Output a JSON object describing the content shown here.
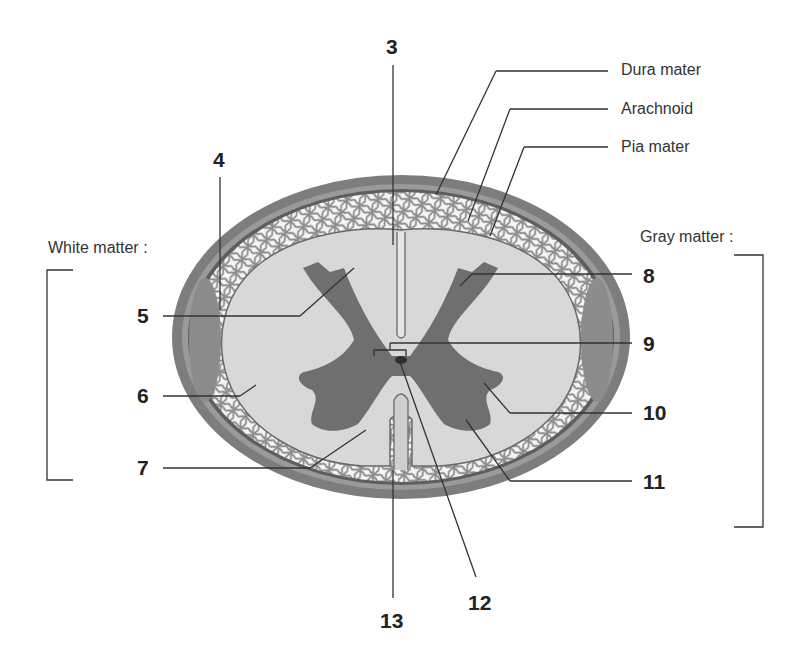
{
  "diagram": {
    "colors": {
      "background": "#ffffff",
      "dura": "#7a7a7a",
      "dura_inner": "#5e5e5e",
      "arachnoid_space": "#f4f4f4",
      "arachnoid_mesh": "#8a8a8a",
      "white_matter": "#d6d6d6",
      "gray_matter": "#6f6f6f",
      "leader_line": "#333333",
      "text": "#222222"
    },
    "named_labels": {
      "dura_mater": "Dura mater",
      "arachnoid": "Arachnoid",
      "pia_mater": "Pia mater"
    },
    "group_labels": {
      "white_matter": "White matter :",
      "gray_matter": "Gray matter :"
    },
    "numbers": {
      "n3": "3",
      "n4": "4",
      "n5": "5",
      "n6": "6",
      "n7": "7",
      "n8": "8",
      "n9": "9",
      "n10": "10",
      "n11": "11",
      "n12": "12",
      "n13": "13"
    }
  }
}
